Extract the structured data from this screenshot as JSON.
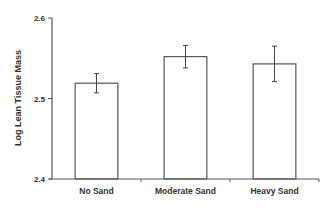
{
  "chart_data": {
    "type": "bar",
    "title": "",
    "xlabel": "",
    "ylabel": "Log Lean Tissue Mass",
    "categories": [
      "No Sand",
      "Moderate Sand",
      "Heavy Sand"
    ],
    "values": [
      2.519,
      2.552,
      2.543
    ],
    "error": [
      0.012,
      0.014,
      0.022
    ],
    "ylim": [
      2.4,
      2.6
    ],
    "yticks": [
      2.4,
      2.5,
      2.6
    ],
    "ytick_labels": [
      "2.4",
      "2.5",
      "2.6"
    ],
    "grid": false,
    "legend": null,
    "colors": {
      "bar_fill": "#ffffff",
      "bar_stroke": "#555555",
      "axis": "#555555",
      "error_bar": "#444444"
    }
  }
}
